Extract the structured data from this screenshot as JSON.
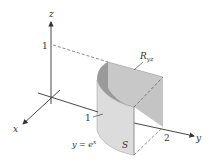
{
  "figure": {
    "axes": {
      "x_label": "x",
      "y_label": "y",
      "z_label": "z"
    },
    "ticks": {
      "z_one": "1",
      "x_one": "1",
      "y_two": "2"
    },
    "labels": {
      "region": "R",
      "region_sub": "yz",
      "surface": "S",
      "curve_lhs": "y = e",
      "curve_exp": "x"
    },
    "colors": {
      "surface_front": "#d4d4d4",
      "surface_back": "#b8b8b8",
      "region_shadow": "#8c8c8c",
      "axis": "#333333",
      "dash": "#555555"
    }
  }
}
